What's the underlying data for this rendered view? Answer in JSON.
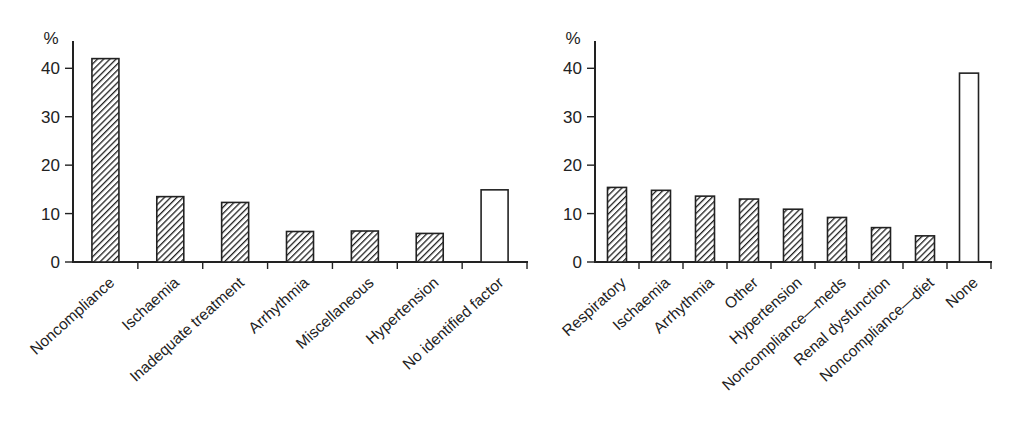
{
  "figure": {
    "background": "#ffffff",
    "ink_color": "#222222",
    "bar_face_color": "#ffffff",
    "hatch_style": "diagonal-forward"
  },
  "chart_data": [
    {
      "type": "bar",
      "title": "",
      "xlabel": "",
      "ylabel": "%",
      "ylim": [
        0,
        45
      ],
      "yticks": [
        0,
        10,
        20,
        30,
        40
      ],
      "grid": false,
      "legend": "none",
      "categories": [
        "Noncompliance",
        "Ischaemia",
        "Inadequate treatment",
        "Arrhythmia",
        "Miscellaneous",
        "Hypertension",
        "No identified factor"
      ],
      "values": [
        42,
        13.5,
        12.3,
        6.3,
        6.4,
        5.9,
        14.9
      ],
      "bar_fill": [
        "hatched",
        "hatched",
        "hatched",
        "hatched",
        "hatched",
        "hatched",
        "white"
      ]
    },
    {
      "type": "bar",
      "title": "",
      "xlabel": "",
      "ylabel": "%",
      "ylim": [
        0,
        45
      ],
      "yticks": [
        0,
        10,
        20,
        30,
        40
      ],
      "grid": false,
      "legend": "none",
      "categories": [
        "Respiratory",
        "Ischaemia",
        "Arrhythmia",
        "Other",
        "Hypertension",
        "Noncompliance—meds",
        "Renal dysfunction",
        "Noncompliance—diet",
        "None"
      ],
      "values": [
        15.4,
        14.8,
        13.6,
        13,
        10.9,
        9.2,
        7.1,
        5.4,
        39
      ],
      "bar_fill": [
        "hatched",
        "hatched",
        "hatched",
        "hatched",
        "hatched",
        "hatched",
        "hatched",
        "hatched",
        "white"
      ]
    }
  ]
}
